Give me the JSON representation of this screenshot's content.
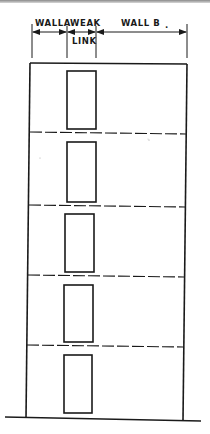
{
  "figure": {
    "type": "elevation-drawing",
    "line_color": "#1a1a1a",
    "background": "#ffffff"
  },
  "dimensions": {
    "wall_a_label": "WALLA",
    "weak_label": "WEAK",
    "link_label": "LINK",
    "wall_b_label": "WALL B",
    "wall_b_suffix": "."
  },
  "building": {
    "storeys": 5,
    "floor_line_style": "dashed",
    "openings": [
      {
        "floor": 5,
        "x": 67,
        "y": 71,
        "w": 29,
        "h": 58
      },
      {
        "floor": 4,
        "x": 67,
        "y": 142,
        "w": 29,
        "h": 60
      },
      {
        "floor": 3,
        "x": 65,
        "y": 214,
        "w": 29,
        "h": 58
      },
      {
        "floor": 2,
        "x": 64,
        "y": 285,
        "w": 29,
        "h": 57
      },
      {
        "floor": 1,
        "x": 64,
        "y": 355,
        "w": 28,
        "h": 58
      }
    ],
    "floor_lines_y": [
      133,
      206,
      276,
      346
    ]
  },
  "ground": {
    "label": ""
  }
}
